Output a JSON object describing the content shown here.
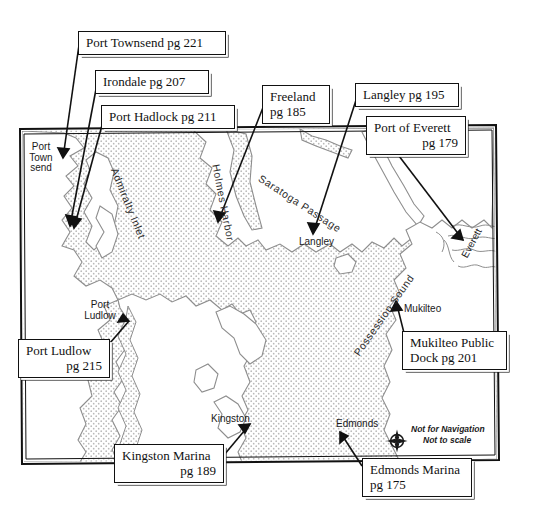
{
  "map": {
    "title_present": false,
    "frame": {
      "x": 20,
      "y": 127,
      "width": 477,
      "height": 336
    },
    "colors": {
      "water_stipple": "#d8d8d8",
      "land_fill": "#ffffff",
      "coastline": "#7a7a7a",
      "frame_line": "#111111",
      "text": "#111111"
    },
    "callouts": [
      {
        "id": "port-townsend",
        "lines": [
          "Port Townsend pg 221"
        ],
        "align": "left",
        "x": 78,
        "y": 31,
        "w": 148,
        "h": 25,
        "place": "Port Townsend",
        "page": 221
      },
      {
        "id": "irondale",
        "lines": [
          "Irondale pg 207"
        ],
        "align": "left",
        "x": 95,
        "y": 70,
        "w": 114,
        "h": 25,
        "place": "Irondale",
        "page": 207
      },
      {
        "id": "port-hadlock",
        "lines": [
          "Port Hadlock pg 211"
        ],
        "align": "left",
        "x": 101,
        "y": 105,
        "w": 134,
        "h": 25,
        "place": "Port Hadlock",
        "page": 211
      },
      {
        "id": "freeland",
        "lines": [
          "Freeland",
          "pg 185"
        ],
        "align": "left",
        "x": 262,
        "y": 85,
        "w": 68,
        "h": 40,
        "place": "Freeland",
        "page": 185
      },
      {
        "id": "langley",
        "lines": [
          "Langley pg 195"
        ],
        "align": "left",
        "x": 355,
        "y": 83,
        "w": 104,
        "h": 25,
        "place": "Langley",
        "page": 195
      },
      {
        "id": "port-of-everett",
        "lines": [
          "Port of Everett",
          "pg 179"
        ],
        "align": "right",
        "x": 366,
        "y": 116,
        "w": 100,
        "h": 40,
        "place": "Port of Everett",
        "page": 179
      },
      {
        "id": "port-ludlow",
        "lines": [
          "Port Ludlow",
          "pg 215"
        ],
        "align": "right",
        "x": 18,
        "y": 339,
        "w": 92,
        "h": 40,
        "place": "Port Ludlow",
        "page": 215
      },
      {
        "id": "mukilteo-public-dock",
        "lines": [
          "Mukilteo Public",
          "Dock pg 201"
        ],
        "align": "left",
        "x": 402,
        "y": 331,
        "w": 105,
        "h": 40,
        "place": "Mukilteo Public Dock",
        "page": 201
      },
      {
        "id": "kingston-marina",
        "lines": [
          "Kingston Marina",
          "pg 189"
        ],
        "align": "right",
        "x": 114,
        "y": 444,
        "w": 110,
        "h": 40,
        "place": "Kingston Marina",
        "page": 189
      },
      {
        "id": "edmonds-marina",
        "lines": [
          "Edmonds Marina",
          "pg 175"
        ],
        "align": "left",
        "x": 362,
        "y": 458,
        "w": 110,
        "h": 40,
        "place": "Edmonds Marina",
        "page": 175
      }
    ],
    "place_labels": [
      {
        "id": "port-townsend-place",
        "lines": [
          "Port",
          "Town",
          "send"
        ],
        "x": 28,
        "y": 144,
        "align": "center"
      },
      {
        "id": "langley-place",
        "lines": [
          "Langley"
        ],
        "x": 299,
        "y": 238,
        "align": "left"
      },
      {
        "id": "port-ludlow-place",
        "lines": [
          "Port",
          "Ludlow"
        ],
        "x": 84,
        "y": 303,
        "align": "center"
      },
      {
        "id": "mukilteo-place",
        "lines": [
          "Mukilteo"
        ],
        "x": 404,
        "y": 306,
        "align": "left"
      },
      {
        "id": "everett-place",
        "lines": [
          "Everett"
        ],
        "x": 462,
        "y": 252,
        "align": "left",
        "rotate": -62
      },
      {
        "id": "kingston-place",
        "lines": [
          "Kingston"
        ],
        "x": 211,
        "y": 415,
        "align": "left"
      },
      {
        "id": "edmonds-place",
        "lines": [
          "Edmonds"
        ],
        "x": 336,
        "y": 420,
        "align": "left"
      }
    ],
    "water_labels": [
      {
        "id": "admiralty-inlet",
        "text": "Admiralty Inlet",
        "x": 119,
        "y": 166,
        "rotate": 68
      },
      {
        "id": "holmes-harbor",
        "text": "Holmes Harbor",
        "x": 221,
        "y": 164,
        "rotate": 79
      },
      {
        "id": "saratoga-passage",
        "text": "Saratoga Passage",
        "x": 262,
        "y": 172,
        "rotate": 33
      },
      {
        "id": "possession-sound",
        "text": "Possession Sound",
        "x": 350,
        "y": 350,
        "rotate": -55
      }
    ],
    "compass": {
      "id": "compass-rose",
      "north_letter": "N",
      "disclaimer_line1": "Not for Navigation",
      "disclaimer_line2": "Not to scale"
    }
  }
}
